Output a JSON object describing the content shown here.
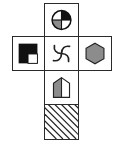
{
  "diagram": {
    "type": "cube-net",
    "colors": {
      "border": "#2a2a2a",
      "black": "#111111",
      "gray": "#8c8c8c",
      "white": "#ffffff"
    },
    "faces": [
      {
        "id": "top",
        "row": 0,
        "col": 1,
        "icon": "quartered-circle-icon",
        "description": "Circle split into quadrants: top-right black, bottom-left gray, others white"
      },
      {
        "id": "left",
        "row": 1,
        "col": 0,
        "icon": "square-corner-icon",
        "description": "Black square with white square in bottom-right corner"
      },
      {
        "id": "center",
        "row": 1,
        "col": 1,
        "icon": "swirl-icon",
        "description": "Four curved arcs forming a swirl"
      },
      {
        "id": "right",
        "row": 1,
        "col": 2,
        "icon": "hexagon-icon",
        "description": "Gray filled hexagon"
      },
      {
        "id": "lower",
        "row": 2,
        "col": 1,
        "icon": "half-house-icon",
        "description": "House pentagon with left half gray, right half white"
      },
      {
        "id": "bottom",
        "row": 3,
        "col": 1,
        "icon": "diagonal-hatch-icon",
        "description": "Diagonal line hatching"
      }
    ]
  }
}
